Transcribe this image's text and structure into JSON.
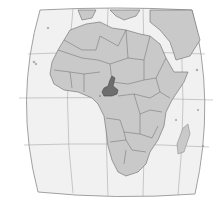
{
  "map": {
    "title": "Africa",
    "region": "Africa",
    "highlighted_country": "Cameroon",
    "colors": {
      "sea": "#f1f1f1",
      "land": "#c9c9c9",
      "highlight": "#6e6e6e",
      "border": "#6a6a6a",
      "graticule": "#9a9a9a"
    },
    "layers": [
      "sea",
      "graticule",
      "land",
      "country-borders",
      "highlighted-country",
      "islands"
    ]
  }
}
